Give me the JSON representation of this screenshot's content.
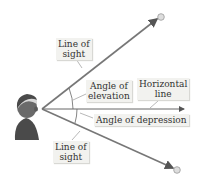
{
  "labels": {
    "line_of_sight_upper": [
      "Line of",
      "sight"
    ],
    "angle_elevation": [
      "Angle of",
      "elevation"
    ],
    "horizontal_line": [
      "Horizontal",
      "line"
    ],
    "angle_depression": "Angle of depression",
    "line_of_sight_lower": [
      "Line of",
      "sight"
    ]
  },
  "colors": {
    "line": "#707070",
    "label_bg": "#f2f2ef",
    "text": "#333333"
  }
}
